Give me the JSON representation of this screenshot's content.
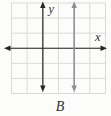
{
  "figure": {
    "caption": "B"
  },
  "colors": {
    "background": "#fcfcfa",
    "grid": "#d8dcd8",
    "axis": "#262626",
    "plotted_line": "#8a8f93",
    "label_text": "#333333"
  },
  "chart_data": {
    "type": "line",
    "title": "",
    "xlabel": "x",
    "ylabel": "y",
    "xlim": [
      -2,
      4
    ],
    "ylim": [
      -3,
      3
    ],
    "grid": true,
    "grid_spacing": 1,
    "axes": {
      "style": "arrows-both-ends",
      "x_axis_row": 0,
      "y_axis_col": 0
    },
    "series": [
      {
        "name": "graph-option-B",
        "description": "vertical line x = 2, arrows on both ends",
        "points": [
          [
            2,
            -3
          ],
          [
            2,
            3
          ]
        ],
        "color": "#8a8f93"
      }
    ],
    "annotations": [
      {
        "text": "B",
        "position": "below-center"
      }
    ]
  }
}
